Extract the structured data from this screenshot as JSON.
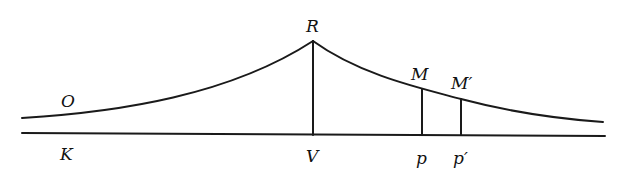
{
  "diagram": {
    "colors": {
      "stroke": "#1a1a1a",
      "text": "#111111",
      "background": "#ffffff"
    },
    "labels": {
      "O": "O",
      "K": "K",
      "R": "R",
      "V": "V",
      "M": "M",
      "M_prime": "M′",
      "p": "p",
      "p_prime": "p′"
    },
    "elements": [
      "baseline K-V-p-p′",
      "curve rising from O to peak R, then decaying through M and M′",
      "vertical RV",
      "vertical Mp",
      "vertical M′p′"
    ]
  }
}
